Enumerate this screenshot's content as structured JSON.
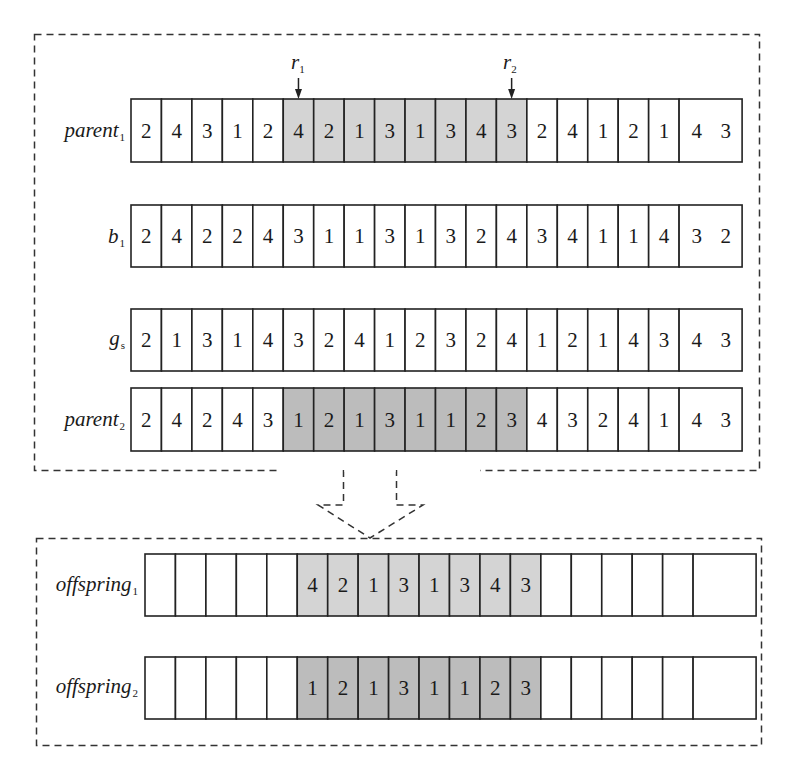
{
  "colors": {
    "stroke": "#222222",
    "dash": "#333333",
    "shade_light": "#d4d4d4",
    "shade_dark": "#bcbcbc",
    "white": "#ffffff"
  },
  "markers": [
    {
      "name": "r",
      "sub": "1",
      "cell_index": 5
    },
    {
      "name": "r",
      "sub": "2",
      "cell_index": 12
    }
  ],
  "top_box": {
    "rows": [
      {
        "id": "parent1",
        "label": "parent",
        "sub": "1",
        "genes": [
          "2",
          "4",
          "3",
          "1",
          "2",
          "4",
          "2",
          "1",
          "3",
          "1",
          "3",
          "4",
          "3",
          "2",
          "4",
          "1",
          "2",
          "1",
          "4 3"
        ],
        "shaded_range": [
          5,
          12
        ],
        "shade": "light"
      },
      {
        "id": "b1",
        "label": "b",
        "sub": "1",
        "genes": [
          "2",
          "4",
          "2",
          "2",
          "4",
          "3",
          "1",
          "1",
          "3",
          "1",
          "3",
          "2",
          "4",
          "3",
          "4",
          "1",
          "1",
          "4",
          "3 2"
        ],
        "shaded_range": null,
        "shade": null
      },
      {
        "id": "gs",
        "label": "g",
        "sub": "s",
        "genes": [
          "2",
          "1",
          "3",
          "1",
          "4",
          "3",
          "2",
          "4",
          "1",
          "2",
          "3",
          "2",
          "4",
          "1",
          "2",
          "1",
          "4",
          "3",
          "4 3"
        ],
        "shaded_range": null,
        "shade": null
      },
      {
        "id": "parent2",
        "label": "parent",
        "sub": "2",
        "genes": [
          "2",
          "4",
          "2",
          "4",
          "3",
          "1",
          "2",
          "1",
          "3",
          "1",
          "1",
          "2",
          "3",
          "4",
          "3",
          "2",
          "4",
          "1",
          "4 3"
        ],
        "shaded_range": [
          5,
          12
        ],
        "shade": "dark"
      }
    ]
  },
  "bottom_box": {
    "rows": [
      {
        "id": "offspring1",
        "label": "offspring",
        "sub": "1",
        "genes": [
          "",
          "",
          "",
          "",
          "",
          "4",
          "2",
          "1",
          "3",
          "1",
          "3",
          "4",
          "3",
          "",
          "",
          "",
          "",
          "",
          ""
        ],
        "shaded_range": [
          5,
          12
        ],
        "shade": "light"
      },
      {
        "id": "offspring2",
        "label": "offspring",
        "sub": "2",
        "genes": [
          "",
          "",
          "",
          "",
          "",
          "1",
          "2",
          "1",
          "3",
          "1",
          "1",
          "2",
          "3",
          "",
          "",
          "",
          "",
          "",
          ""
        ],
        "shaded_range": [
          5,
          12
        ],
        "shade": "dark"
      }
    ]
  }
}
